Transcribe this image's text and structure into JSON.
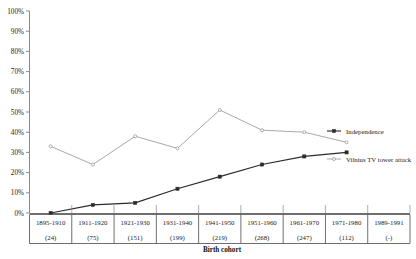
{
  "chart_data": {
    "type": "line",
    "title": "",
    "xlabel": "Birth cohort",
    "ylabel": "",
    "ylim": [
      0,
      100
    ],
    "grid": false,
    "legend_position": "right",
    "categories": [
      "1895-1910",
      "1911-1920",
      "1921-1930",
      "1931-1940",
      "1941-1950",
      "1951-1960",
      "1961-1970",
      "1971-1980",
      "1989-1991"
    ],
    "category_counts": [
      "(24)",
      "(75)",
      "(151)",
      "(199)",
      "(219)",
      "(268)",
      "(247)",
      "(112)",
      "(-)"
    ],
    "ytick_labels": [
      "0%",
      "10%",
      "20%",
      "30%",
      "40%",
      "50%",
      "60%",
      "70%",
      "80%",
      "90%",
      "100%"
    ],
    "ytick_values": [
      0,
      10,
      20,
      30,
      40,
      50,
      60,
      70,
      80,
      90,
      100
    ],
    "series": [
      {
        "name": "Independence",
        "color": "#2b2b2b",
        "marker": "filled-square",
        "values": [
          0,
          4,
          5,
          12,
          18,
          24,
          28,
          30,
          null
        ]
      },
      {
        "name": "Vilnius TV tower attack",
        "color": "#9a9a9a",
        "marker": "open-circle",
        "values": [
          33,
          24,
          38,
          32,
          51,
          41,
          40,
          35,
          null
        ]
      }
    ]
  },
  "legend": {
    "items": [
      {
        "label": "Independence"
      },
      {
        "label": "Vilnius TV tower attack"
      }
    ]
  },
  "axes": {
    "x_title": "Birth cohort"
  }
}
